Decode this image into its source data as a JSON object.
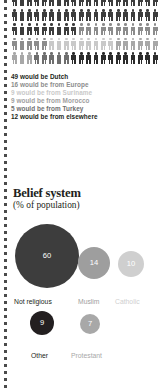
{
  "pictogram": {
    "total_figures": 100,
    "per_row": 20,
    "rows": 5,
    "segments": [
      {
        "name": "Dutch",
        "count": 49,
        "color": "#3d3d3d"
      },
      {
        "name": "Europe",
        "count": 16,
        "color": "#8c8c8c"
      },
      {
        "name": "Suriname",
        "count": 9,
        "color": "#c9c9c9"
      },
      {
        "name": "Morocco",
        "count": 9,
        "color": "#a8a8a8"
      },
      {
        "name": "Turkey",
        "count": 5,
        "color": "#6e6e6e"
      },
      {
        "name": "elsewhere",
        "count": 12,
        "color": "#2b2b2b"
      }
    ],
    "legend": [
      {
        "text": "49 would be Dutch",
        "color": "#231f20"
      },
      {
        "text": "16 would be from Europe",
        "color": "#8c8c8c"
      },
      {
        "text": "9 would be from Suriname",
        "color": "#c9c9c9"
      },
      {
        "text": "9 would be from Morocco",
        "color": "#a0a0a0"
      },
      {
        "text": "5 would be from Turkey",
        "color": "#6e6e6e"
      },
      {
        "text": "12 would be from elsewhere",
        "color": "#231f20"
      }
    ]
  },
  "belief": {
    "title": "Belief system",
    "subtitle": "(% of population)",
    "items": [
      {
        "label": "Not religious",
        "value": "60",
        "value_num": 60,
        "color": "#3d3d3d",
        "label_color": "#231f20",
        "cx": 47,
        "cy": 256,
        "r": 32,
        "label_x": 14,
        "label_y": 294
      },
      {
        "label": "Muslim",
        "value": "14",
        "value_num": 14,
        "color": "#9e9e9e",
        "label_color": "#9e9e9e",
        "cx": 94,
        "cy": 263,
        "r": 16,
        "label_x": 78,
        "label_y": 294
      },
      {
        "label": "Catholic",
        "value": "10",
        "value_num": 10,
        "color": "#cfcfcf",
        "label_color": "#cfcfcf",
        "cx": 131,
        "cy": 264,
        "r": 13,
        "label_x": 115,
        "label_y": 294
      },
      {
        "label": "Other",
        "value": "9",
        "value_num": 9,
        "color": "#231f20",
        "label_color": "#231f20",
        "cx": 42,
        "cy": 323,
        "r": 12,
        "label_x": 31,
        "label_y": 348
      },
      {
        "label": "Protestant",
        "value": "7",
        "value_num": 7,
        "color": "#a8a8a8",
        "label_color": "#a8a8a8",
        "cx": 90,
        "cy": 324,
        "r": 10,
        "label_x": 71,
        "label_y": 348
      }
    ]
  },
  "chart_data": {
    "type": "pie",
    "title": "Belief system",
    "subtitle": "(% of population)",
    "ylabel": "% of population",
    "categories": [
      "Not religious",
      "Muslim",
      "Catholic",
      "Other",
      "Protestant"
    ],
    "values": [
      60,
      14,
      10,
      9,
      7
    ],
    "legend": "inline-labels",
    "grid": false,
    "secondary": {
      "type": "bar",
      "title": "If the Netherlands were 100 people",
      "categories": [
        "Dutch",
        "Europe",
        "Suriname",
        "Morocco",
        "Turkey",
        "elsewhere"
      ],
      "values": [
        49,
        16,
        9,
        9,
        5,
        12
      ]
    }
  }
}
